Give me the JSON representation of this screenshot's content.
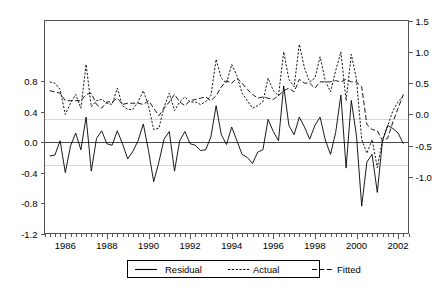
{
  "chart_data": {
    "type": "line",
    "title": "",
    "xlabel": "",
    "ylabel": "",
    "grid": true,
    "legend_position": "bottom-center",
    "x_axis": {
      "start": 1985.0,
      "end": 2002.5,
      "major_ticks": [
        "1986",
        "1988",
        "1990",
        "1992",
        "1994",
        "1996",
        "1998",
        "2000",
        "2002"
      ],
      "major_tick_values": [
        1986,
        1988,
        1990,
        1992,
        1994,
        1996,
        1998,
        2000,
        2002
      ],
      "minor_tick_interval": 0.25
    },
    "y_axis_left": {
      "label": "Residual",
      "ticks": [
        "0.8",
        "0.4",
        "0.0",
        "-0.4",
        "-0.8",
        "-1.2"
      ],
      "tick_values": [
        0.8,
        0.4,
        0.0,
        -0.4,
        -0.8,
        -1.2
      ],
      "ylim": [
        -1.2,
        1.6
      ]
    },
    "y_axis_right": {
      "label": "Actual / Fitted",
      "ticks": [
        "1.5",
        "1.0",
        "0.5",
        "0.0",
        "-0.5",
        "-1.0"
      ],
      "tick_values": [
        1.5,
        1.0,
        0.5,
        0.0,
        -0.5,
        -1.0
      ],
      "ylim": [
        -1.9,
        1.5
      ]
    },
    "gridlines_left": [
      0.3,
      0.0,
      -0.3
    ],
    "series": [
      {
        "name": "Residual",
        "axis": "left",
        "style": "solid",
        "x": [
          1985.25,
          1985.5,
          1985.75,
          1986.0,
          1986.25,
          1986.5,
          1986.75,
          1987.0,
          1987.25,
          1987.5,
          1987.75,
          1988.0,
          1988.25,
          1988.5,
          1988.75,
          1989.0,
          1989.25,
          1989.5,
          1989.75,
          1990.0,
          1990.25,
          1990.5,
          1990.75,
          1991.0,
          1991.25,
          1991.5,
          1991.75,
          1992.0,
          1992.25,
          1992.5,
          1992.75,
          1993.0,
          1993.25,
          1993.5,
          1993.75,
          1994.0,
          1994.25,
          1994.5,
          1994.75,
          1995.0,
          1995.25,
          1995.5,
          1995.75,
          1996.0,
          1996.25,
          1996.5,
          1996.75,
          1997.0,
          1997.25,
          1997.5,
          1997.75,
          1998.0,
          1998.25,
          1998.5,
          1998.75,
          1999.0,
          1999.25,
          1999.5,
          1999.75,
          2000.0,
          2000.25,
          2000.5,
          2000.75,
          2001.0,
          2001.25,
          2001.5,
          2001.75,
          2002.0,
          2002.25
        ],
        "values": [
          -0.18,
          -0.17,
          0.02,
          -0.4,
          -0.05,
          0.12,
          -0.1,
          0.33,
          -0.38,
          0.05,
          0.15,
          -0.02,
          -0.04,
          0.15,
          -0.02,
          -0.22,
          -0.12,
          0.02,
          0.24,
          -0.11,
          -0.52,
          -0.26,
          0.04,
          0.14,
          -0.38,
          0.02,
          0.14,
          -0.02,
          -0.04,
          -0.11,
          -0.1,
          0.07,
          0.48,
          0.1,
          -0.03,
          0.2,
          0.02,
          -0.16,
          -0.2,
          -0.28,
          -0.13,
          -0.1,
          0.3,
          0.14,
          0.02,
          0.74,
          0.22,
          0.1,
          0.33,
          0.2,
          0.04,
          0.22,
          0.33,
          0.03,
          -0.16,
          0.13,
          0.62,
          -0.34,
          0.55,
          0.08,
          -0.84,
          -0.26,
          -0.16,
          -0.66,
          0.02,
          0.22,
          0.18,
          0.12,
          -0.02
        ]
      },
      {
        "name": "Actual",
        "axis": "right",
        "style": "dotted",
        "x": [
          1985.25,
          1985.5,
          1985.75,
          1986.0,
          1986.25,
          1986.5,
          1986.75,
          1987.0,
          1987.25,
          1987.5,
          1987.75,
          1988.0,
          1988.25,
          1988.5,
          1988.75,
          1989.0,
          1989.25,
          1989.5,
          1989.75,
          1990.0,
          1990.25,
          1990.5,
          1990.75,
          1991.0,
          1991.25,
          1991.5,
          1991.75,
          1992.0,
          1992.25,
          1992.5,
          1992.75,
          1993.0,
          1993.25,
          1993.5,
          1993.75,
          1994.0,
          1994.25,
          1994.5,
          1994.75,
          1995.0,
          1995.25,
          1995.5,
          1995.75,
          1996.0,
          1996.25,
          1996.5,
          1996.75,
          1997.0,
          1997.25,
          1997.5,
          1997.75,
          1998.0,
          1998.25,
          1998.5,
          1998.75,
          1999.0,
          1999.25,
          1999.5,
          1999.75,
          2000.0,
          2000.25,
          2000.5,
          2000.75,
          2001.0,
          2001.25,
          2001.5,
          2001.75,
          2002.0,
          2002.25
        ],
        "values": [
          0.52,
          0.5,
          0.4,
          0.0,
          0.18,
          0.32,
          0.1,
          0.8,
          0.12,
          0.22,
          0.24,
          0.18,
          0.16,
          0.42,
          0.14,
          0.08,
          0.08,
          0.2,
          0.38,
          0.14,
          -0.24,
          -0.22,
          0.12,
          0.34,
          0.06,
          0.2,
          0.28,
          0.2,
          0.2,
          0.16,
          0.2,
          0.3,
          0.88,
          0.58,
          0.5,
          0.8,
          0.62,
          0.34,
          0.22,
          0.1,
          0.14,
          0.2,
          0.58,
          0.38,
          0.3,
          1.0,
          0.56,
          0.44,
          1.12,
          0.74,
          0.52,
          0.58,
          0.92,
          0.54,
          0.36,
          0.7,
          1.0,
          0.22,
          0.96,
          0.56,
          -0.4,
          -0.62,
          -0.4,
          -0.85,
          -0.4,
          -0.18,
          0.06,
          0.2,
          0.3
        ]
      },
      {
        "name": "Fitted",
        "axis": "right",
        "style": "dashed",
        "x": [
          1985.25,
          1985.5,
          1985.75,
          1986.0,
          1986.25,
          1986.5,
          1986.75,
          1987.0,
          1987.25,
          1987.5,
          1987.75,
          1988.0,
          1988.25,
          1988.5,
          1988.75,
          1989.0,
          1989.25,
          1989.5,
          1989.75,
          1990.0,
          1990.25,
          1990.5,
          1990.75,
          1991.0,
          1991.25,
          1991.5,
          1991.75,
          1992.0,
          1992.25,
          1992.5,
          1992.75,
          1993.0,
          1993.25,
          1993.5,
          1993.75,
          1994.0,
          1994.25,
          1994.5,
          1994.75,
          1995.0,
          1995.25,
          1995.5,
          1995.75,
          1996.0,
          1996.25,
          1996.5,
          1996.75,
          1997.0,
          1997.25,
          1997.5,
          1997.75,
          1998.0,
          1998.25,
          1998.5,
          1998.75,
          1999.0,
          1999.25,
          1999.5,
          1999.75,
          2000.0,
          2000.25,
          2000.5,
          2000.75,
          2001.0,
          2001.25,
          2001.5,
          2001.75,
          2002.0,
          2002.25
        ],
        "values": [
          0.38,
          0.36,
          0.34,
          0.22,
          0.22,
          0.22,
          0.22,
          0.32,
          0.34,
          0.16,
          0.1,
          0.2,
          0.2,
          0.26,
          0.16,
          0.18,
          0.18,
          0.18,
          0.16,
          0.22,
          0.1,
          -0.02,
          0.1,
          0.2,
          0.32,
          0.2,
          0.14,
          0.22,
          0.24,
          0.26,
          0.28,
          0.22,
          0.3,
          0.44,
          0.54,
          0.5,
          0.58,
          0.5,
          0.4,
          0.32,
          0.26,
          0.28,
          0.26,
          0.24,
          0.3,
          0.38,
          0.42,
          0.36,
          0.56,
          0.5,
          0.5,
          0.42,
          0.52,
          0.52,
          0.52,
          0.54,
          0.52,
          0.56,
          0.52,
          0.52,
          0.44,
          -0.16,
          -0.24,
          -0.26,
          -0.42,
          -0.38,
          -0.12,
          0.1,
          0.32
        ]
      }
    ]
  },
  "legend": {
    "items": [
      {
        "label": "Residual",
        "style": "solid"
      },
      {
        "label": "Actual",
        "style": "dotted"
      },
      {
        "label": "Fitted",
        "style": "dashed"
      }
    ]
  },
  "colors": {
    "series_line": "#000000",
    "frame": "#555555",
    "gridline": "#d8d8d8",
    "zeroline": "#4a4a4a",
    "background": "#ffffff"
  }
}
